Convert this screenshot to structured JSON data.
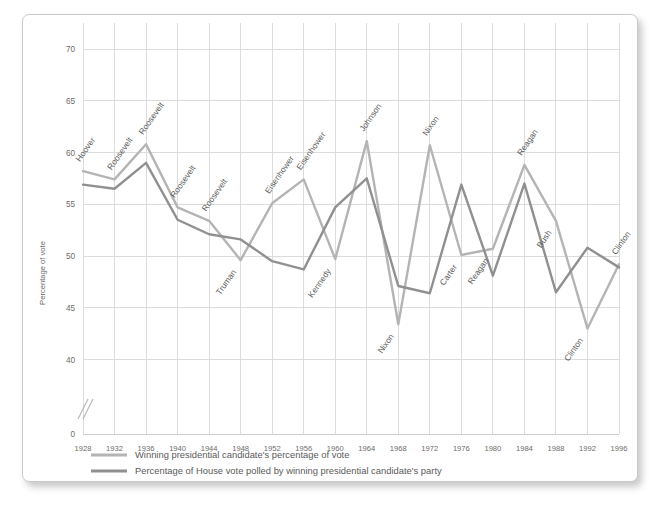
{
  "chart_data": {
    "type": "line",
    "title": "",
    "xlabel": "",
    "ylabel": "Percentage of vote",
    "x": [
      1928,
      1932,
      1936,
      1940,
      1944,
      1948,
      1952,
      1956,
      1960,
      1964,
      1968,
      1972,
      1976,
      1980,
      1984,
      1988,
      1992,
      1996
    ],
    "xtick_labels": [
      "1928",
      "1932",
      "1936",
      "1940",
      "1944",
      "1948",
      "1952",
      "1956",
      "1960",
      "1964",
      "1968",
      "1972",
      "1976",
      "1980",
      "1984",
      "1988",
      "1992",
      "1996"
    ],
    "ytick_labels": [
      "0",
      "40",
      "45",
      "50",
      "55",
      "60",
      "65",
      "70"
    ],
    "ytick_values": [
      0,
      40,
      45,
      50,
      55,
      60,
      65,
      70
    ],
    "ylim": [
      40,
      72
    ],
    "axis_break": true,
    "grid": true,
    "legend_position": "bottom-left",
    "series": [
      {
        "name": "Winning presidential candidate's percentage of vote",
        "color": "#b4b4b4",
        "values": [
          58.2,
          57.4,
          60.8,
          54.7,
          53.4,
          49.6,
          55.1,
          57.4,
          49.7,
          61.1,
          43.4,
          60.7,
          50.1,
          50.7,
          58.8,
          53.4,
          43.0,
          49.2
        ]
      },
      {
        "name": "Percentage of House vote polled by winning presidential candidate's party",
        "color": "#909090",
        "values": [
          56.9,
          56.5,
          59.0,
          53.5,
          52.1,
          51.6,
          49.5,
          48.7,
          54.7,
          57.5,
          47.1,
          46.4,
          56.9,
          48.1,
          57.0,
          46.5,
          50.8,
          48.9
        ]
      }
    ],
    "annotations": [
      {
        "label": "Hoover",
        "x": 1928,
        "series": 0
      },
      {
        "label": "Roosevelt",
        "x": 1932,
        "series": 0
      },
      {
        "label": "Roosevelt",
        "x": 1936,
        "series": 0
      },
      {
        "label": "Roosevelt",
        "x": 1940,
        "series": 0
      },
      {
        "label": "Roosevelt",
        "x": 1944,
        "series": 0
      },
      {
        "label": "Truman",
        "x": 1948,
        "series": 0
      },
      {
        "label": "Eisenhower",
        "x": 1952,
        "series": 0
      },
      {
        "label": "Eisenhower",
        "x": 1956,
        "series": 0
      },
      {
        "label": "Kennedy",
        "x": 1960,
        "series": 0
      },
      {
        "label": "Johnson",
        "x": 1964,
        "series": 0
      },
      {
        "label": "Nixon",
        "x": 1968,
        "series": 0
      },
      {
        "label": "Nixon",
        "x": 1972,
        "series": 0
      },
      {
        "label": "Carter",
        "x": 1976,
        "series": 0
      },
      {
        "label": "Reagan",
        "x": 1980,
        "series": 0
      },
      {
        "label": "Reagan",
        "x": 1984,
        "series": 0
      },
      {
        "label": "Bush",
        "x": 1988,
        "series": 0
      },
      {
        "label": "Clinton",
        "x": 1992,
        "series": 0
      },
      {
        "label": "Clinton",
        "x": 1996,
        "series": 0
      }
    ]
  },
  "legend": {
    "items": [
      {
        "label": "Winning presidential candidate's percentage of vote",
        "color": "#b4b4b4"
      },
      {
        "label": "Percentage of House vote polled by winning presidential candidate's party",
        "color": "#909090"
      }
    ]
  }
}
